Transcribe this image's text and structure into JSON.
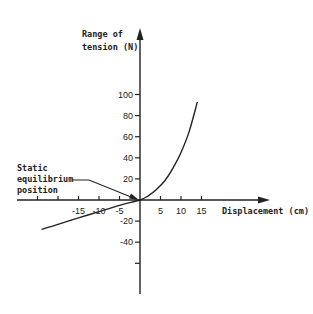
{
  "chart_data": {
    "type": "line",
    "title": "",
    "ylabel": "Range of tension (N)",
    "ylabel_lines": [
      "Range of",
      "tension (N)"
    ],
    "xlabel": "Displacement (cm)",
    "xlim": [
      -25,
      20
    ],
    "ylim": [
      -60,
      120
    ],
    "grid": false,
    "legend": null,
    "x_ticks": [
      -25,
      -20,
      -15,
      -10,
      -5,
      5,
      10,
      15
    ],
    "x_tick_labels": [
      "",
      "",
      "-15",
      "-10",
      "-5",
      "5",
      "10",
      "15"
    ],
    "y_ticks": [
      100,
      80,
      60,
      40,
      20,
      -20,
      -40,
      -60
    ],
    "y_tick_labels": [
      "100",
      "80",
      "60",
      "40",
      "20",
      "-20",
      "-40",
      ""
    ],
    "series": [
      {
        "name": "Tension vs displacement",
        "x": [
          -24,
          -20,
          -15,
          -10,
          -5,
          0,
          2,
          4,
          6,
          8,
          10,
          12,
          14
        ],
        "y": [
          -28,
          -23,
          -17,
          -11,
          -5,
          0,
          4,
          10,
          18,
          30,
          45,
          65,
          93
        ]
      }
    ],
    "annotations": [
      {
        "text": "Static equilibrium position",
        "lines": [
          "Static",
          "equilibrium",
          "position"
        ],
        "points_to": [
          0,
          0
        ]
      }
    ]
  }
}
